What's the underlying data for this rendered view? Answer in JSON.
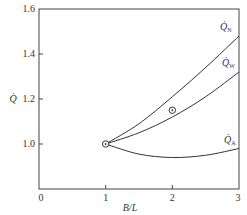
{
  "chart_data": {
    "type": "line",
    "title": "",
    "xlabel": "B/L",
    "ylabel": "Q̇",
    "xlim": [
      0,
      3
    ],
    "ylim": [
      0.8,
      1.6
    ],
    "x_ticks": [
      "0",
      "1",
      "2",
      "3"
    ],
    "y_ticks": [
      "1.0",
      "1.2",
      "1.4",
      "1.6"
    ],
    "grid": false,
    "legend": "inline labels at right end of curves",
    "series": [
      {
        "name": "Q̇N",
        "label_main": "Q̇",
        "label_sub": "N",
        "x": [
          1,
          1.5,
          2,
          2.5,
          3
        ],
        "y": [
          1.0,
          1.09,
          1.21,
          1.34,
          1.48
        ]
      },
      {
        "name": "Q̇W",
        "label_main": "Q̇",
        "label_sub": "W",
        "x": [
          1,
          1.5,
          2,
          2.5,
          3
        ],
        "y": [
          1.0,
          1.05,
          1.12,
          1.21,
          1.32
        ]
      },
      {
        "name": "Q̇A",
        "label_main": "Q̇",
        "label_sub": "A",
        "x": [
          1,
          1.5,
          2,
          2.5,
          3
        ],
        "y": [
          1.0,
          0.955,
          0.94,
          0.95,
          0.98
        ]
      }
    ],
    "markers": [
      {
        "x": 1,
        "y": 1.0,
        "style": "circled-dot"
      },
      {
        "x": 2,
        "y": 1.15,
        "style": "circled-dot"
      }
    ]
  }
}
